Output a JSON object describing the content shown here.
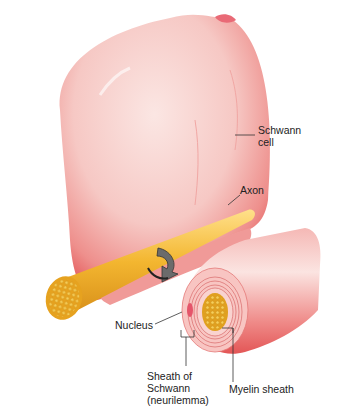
{
  "diagram": {
    "labels": {
      "schwann_cell": "Schwann\ncell",
      "schwann_cell_line1": "Schwann",
      "schwann_cell_line2": "cell",
      "axon": "Axon",
      "nucleus": "Nucleus",
      "sheath_line1": "Sheath of",
      "sheath_line2": "Schwann",
      "sheath_line3": "(neurilemma)",
      "myelin_sheath": "Myelin sheath"
    },
    "icons": {
      "rotation_arrow": "curved-arrow-icon"
    },
    "colors": {
      "schwann_pink": "#f7c4c2",
      "schwann_red": "#e8484a",
      "axon_yellow": "#f2b52a",
      "axon_core": "#d99a1a",
      "leader_line": "#333333"
    }
  }
}
